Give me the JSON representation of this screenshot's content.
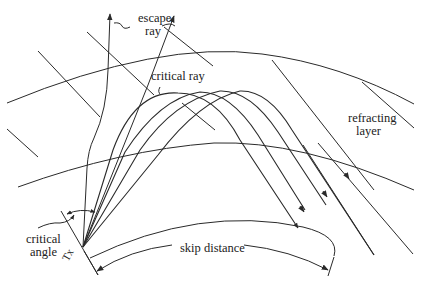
{
  "diagram": {
    "type": "ionospheric-skip-propagation",
    "colors": {
      "line": "#2a2a2a",
      "background": "#ffffff",
      "text": "#222222"
    },
    "labels": {
      "escape_ray_line1": "escape",
      "escape_ray_line2": "ray",
      "critical_ray": "critical ray",
      "refracting_layer_line1": "refracting",
      "refracting_layer_line2": "layer",
      "critical_angle_line1": "critical",
      "critical_angle_line2": "angle",
      "transmitter": "Tx",
      "skip_distance": "skip distance"
    },
    "elements": {
      "earth_surface": "curved ground arc",
      "layer_lower_boundary": "inner arc of refracting layer",
      "layer_upper_boundary": "outer arc of refracting layer",
      "escape_rays": 2,
      "refracted_rays": 4,
      "incoming_parallel_rays": 6
    }
  }
}
